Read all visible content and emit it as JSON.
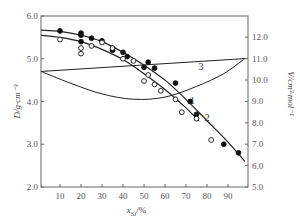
{
  "chart_data": {
    "type": "scatter",
    "title": "",
    "xlabel": "x_Si/%",
    "ylabel_left": "D/g·cm⁻³",
    "ylabel_right": "V/cm³·mol⁻¹",
    "x_ticks": [
      10,
      20,
      30,
      40,
      50,
      60,
      70,
      80,
      90
    ],
    "xlim": [
      1,
      98
    ],
    "y_left_ticks": [
      "2.0",
      "3.0",
      "4.0",
      "5.0",
      "6.0"
    ],
    "ylim_left": [
      2.0,
      6.0
    ],
    "y_right_ticks": [
      "5.0",
      "6.0",
      "7.0",
      "8.0",
      "9.0",
      "10.0",
      "11.0",
      "12.0"
    ],
    "ylim_right": [
      5.0,
      13.0
    ],
    "grid": false,
    "legend": "curve numbers annotated inline (1, 2, 3)",
    "series": [
      {
        "name": "1",
        "axis": "left",
        "marker": "filled-circle",
        "line": "fit curve",
        "points": [
          [
            10,
            5.65
          ],
          [
            20,
            5.6
          ],
          [
            20,
            5.55
          ],
          [
            20,
            5.4
          ],
          [
            25,
            5.48
          ],
          [
            30,
            5.42
          ],
          [
            35,
            5.2
          ],
          [
            40,
            5.15
          ],
          [
            42,
            5.05
          ],
          [
            50,
            4.8
          ],
          [
            52,
            4.92
          ],
          [
            55,
            4.78
          ],
          [
            65,
            4.43
          ],
          [
            72,
            4.0
          ],
          [
            75,
            3.7
          ],
          [
            88,
            3.0
          ],
          [
            95,
            2.8
          ]
        ],
        "curve": [
          [
            1,
            5.67
          ],
          [
            10,
            5.64
          ],
          [
            20,
            5.55
          ],
          [
            30,
            5.4
          ],
          [
            40,
            5.15
          ],
          [
            50,
            4.85
          ],
          [
            60,
            4.5
          ],
          [
            70,
            4.05
          ],
          [
            80,
            3.55
          ],
          [
            90,
            3.05
          ],
          [
            98,
            2.6
          ]
        ]
      },
      {
        "name": "2",
        "axis": "left",
        "marker": "open-circle",
        "line": "fit curve",
        "points": [
          [
            10,
            5.45
          ],
          [
            20,
            5.25
          ],
          [
            20,
            5.12
          ],
          [
            25,
            5.3
          ],
          [
            30,
            5.38
          ],
          [
            35,
            5.25
          ],
          [
            40,
            5.0
          ],
          [
            45,
            4.95
          ],
          [
            50,
            4.48
          ],
          [
            52,
            4.62
          ],
          [
            55,
            4.4
          ],
          [
            58,
            4.25
          ],
          [
            65,
            4.05
          ],
          [
            68,
            3.75
          ],
          [
            75,
            3.6
          ],
          [
            82,
            3.1
          ]
        ],
        "curve": [
          [
            1,
            5.55
          ],
          [
            10,
            5.5
          ],
          [
            20,
            5.4
          ],
          [
            30,
            5.22
          ],
          [
            40,
            4.98
          ],
          [
            50,
            4.65
          ],
          [
            60,
            4.28
          ],
          [
            70,
            3.85
          ],
          [
            76,
            3.55
          ]
        ]
      },
      {
        "name": "3",
        "axis": "right",
        "marker": "none",
        "line": "lens (straight upper + curved lower)",
        "upper": [
          [
            1,
            10.4
          ],
          [
            98,
            11.0
          ]
        ],
        "lower": [
          [
            1,
            10.4
          ],
          [
            15,
            9.85
          ],
          [
            30,
            9.35
          ],
          [
            45,
            9.1
          ],
          [
            60,
            9.2
          ],
          [
            75,
            9.7
          ],
          [
            88,
            10.3
          ],
          [
            98,
            11.0
          ]
        ]
      }
    ],
    "annotations": [
      {
        "text": "1",
        "x": 70,
        "axis": "left",
        "y": 3.95
      },
      {
        "text": "2",
        "x": 77,
        "axis": "left",
        "y": 3.55
      },
      {
        "text": "3",
        "x": 74,
        "axis": "right",
        "y": 10.45
      }
    ]
  },
  "labels": {
    "xlabel_main": "x",
    "xlabel_sub": "Si",
    "xlabel_unit": "/%",
    "ylabel_left": "D/g·cm⁻³",
    "ylabel_right": "V/cm³·mol⁻¹"
  }
}
